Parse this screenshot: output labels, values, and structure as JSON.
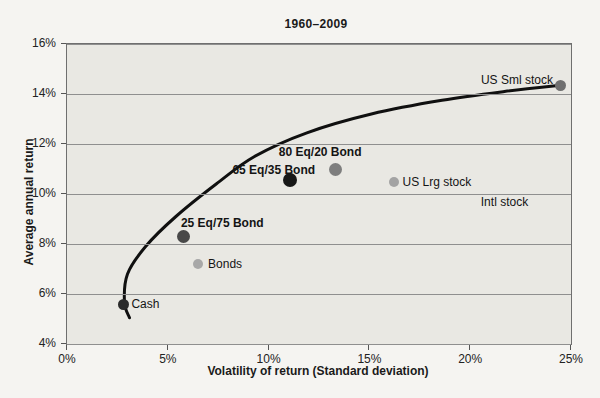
{
  "chart_data": {
    "type": "scatter",
    "title": "1960–2009",
    "xlabel": "Volatility of return (Standard deviation)",
    "ylabel": "Average annual return",
    "xlim": [
      0,
      25
    ],
    "ylim": [
      4,
      16
    ],
    "x_ticks": [
      0,
      5,
      10,
      15,
      20,
      25
    ],
    "y_ticks": [
      4,
      6,
      8,
      10,
      12,
      14,
      16
    ],
    "x_tick_suffix": "%",
    "y_tick_suffix": "%",
    "grid": "horizontal",
    "legend": "none",
    "plot_bg": "#e9e8e3",
    "gridline_color": "#8f8f8f",
    "points": [
      {
        "label": "Cash",
        "x": 2.8,
        "y": 5.6,
        "color": "#2b2b2b",
        "size": 11,
        "bold": false,
        "label_anchor": "start",
        "label_dx": 8,
        "label_dy": 0
      },
      {
        "label": "Bonds",
        "x": 6.5,
        "y": 7.2,
        "color": "#a8a8a8",
        "size": 10,
        "bold": false,
        "label_anchor": "start",
        "label_dx": 10,
        "label_dy": 0
      },
      {
        "label": "25 Eq/75 Bond",
        "x": 5.8,
        "y": 8.3,
        "color": "#484848",
        "size": 13,
        "bold": true,
        "label_anchor": "start",
        "label_dx": -3,
        "label_dy": -14
      },
      {
        "label": "65 Eq/35 Bond",
        "x": 11.05,
        "y": 10.55,
        "color": "#171717",
        "size": 14,
        "bold": true,
        "label_anchor": "middle",
        "label_dx": -16,
        "label_dy": -10
      },
      {
        "label": "80 Eq/20 Bond",
        "x": 13.3,
        "y": 11.0,
        "color": "#7e7e7e",
        "size": 13,
        "bold": true,
        "label_anchor": "middle",
        "label_dx": -15,
        "label_dy": -17
      },
      {
        "label": "US Lrg stock",
        "x": 16.2,
        "y": 10.5,
        "color": "#a3a3a3",
        "size": 10,
        "bold": false,
        "label_anchor": "start",
        "label_dx": 9,
        "label_dy": 0
      },
      {
        "label": "US Sml stock",
        "x": 24.5,
        "y": 14.35,
        "color": "#6f6f6f",
        "size": 11,
        "bold": false,
        "label_anchor": "end",
        "label_dx": -8,
        "label_dy": -5
      }
    ],
    "annotations": [
      {
        "text": "Intl stock",
        "x": 21.7,
        "y": 9.7
      }
    ],
    "frontier_curve": {
      "name": "efficient-frontier",
      "color": "#101010",
      "stroke_width": 3,
      "points": [
        [
          3.1,
          5.05
        ],
        [
          2.85,
          5.65
        ],
        [
          3.0,
          6.8
        ],
        [
          3.9,
          7.9
        ],
        [
          5.4,
          9.1
        ],
        [
          7.4,
          10.4
        ],
        [
          9.3,
          11.5
        ],
        [
          11.9,
          12.45
        ],
        [
          15.1,
          13.2
        ],
        [
          18.6,
          13.75
        ],
        [
          21.7,
          14.1
        ],
        [
          24.5,
          14.35
        ]
      ]
    }
  }
}
